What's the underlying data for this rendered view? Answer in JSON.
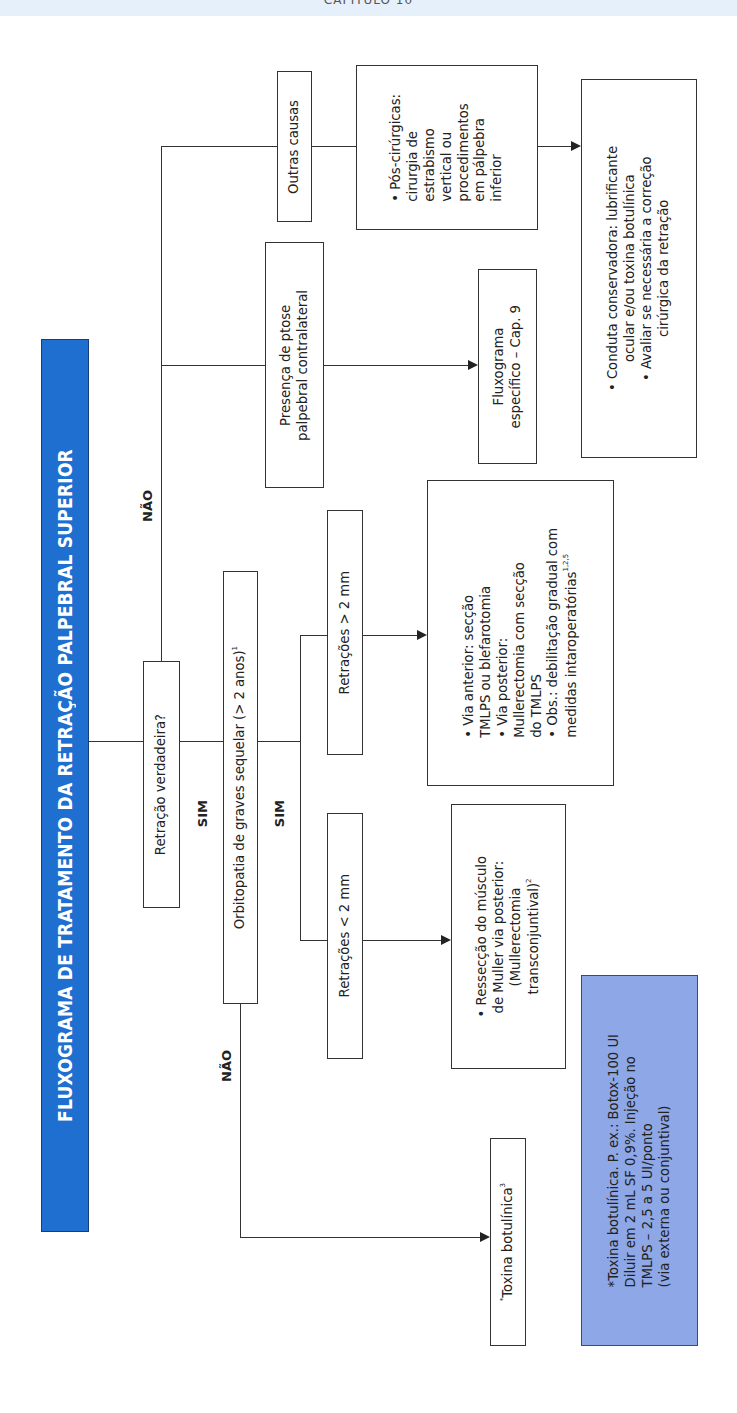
{
  "header": {
    "chapter": "CAPÍTULO 10"
  },
  "title": "FLUXOGRAMA DE TRATAMENTO DA RETRAÇÃO PALPEBRAL SUPERIOR",
  "colors": {
    "title_bg": "#1f6fd1",
    "note_bg": "#8ea7e6",
    "header_band": "#e6f0fb",
    "line": "#333333"
  },
  "nodes": {
    "retracao_verdadeira": {
      "label": "Retração verdadeira?"
    },
    "orbitopatia": {
      "label": "Orbitopatia de graves sequelar (> 2 anos)",
      "sup": "1"
    },
    "retracoes_menor": {
      "label": "Retrações < 2 mm"
    },
    "retracoes_maior": {
      "label": "Retrações > 2 mm"
    },
    "resseccao": {
      "lines": [
        "• Ressecção do músculo",
        "de Muller via posterior:",
        "(Mullerectomia",
        "transconjuntival)"
      ],
      "sup": "2"
    },
    "via_anterior": {
      "lines": [
        "• Via anterior:  secção",
        "TMLPS ou blefarotomia",
        "• Via posterior:",
        "Mullerectomia com secção",
        "do TMLPS",
        "• Obs.: debilitação gradual com",
        "medidas intaroperatórias"
      ],
      "sup": "1,2,5"
    },
    "toxina": {
      "prefix": "*",
      "label": "Toxina botulínica",
      "sup": "3"
    },
    "presenca_ptose": {
      "lines": [
        "Presença de ptose",
        "palpebral contralateral"
      ]
    },
    "fluxograma_especifico": {
      "lines": [
        "Fluxograma",
        "específico – Cap. 9"
      ]
    },
    "outras_causas": {
      "label": "Outras causas"
    },
    "pos_cirurgicas": {
      "lines": [
        "• Pós-cirúrgicas:",
        "cirurgia de",
        "estrabismo",
        "vertical ou",
        "procedimentos",
        "em pálpebra",
        "inferior"
      ]
    },
    "conduta": {
      "lines": [
        "• Conduta conservadora: lubrificante",
        "ocular e/ou toxina botulínica",
        "• Avaliar se necessária a correção",
        "cirúrgica da retração"
      ]
    }
  },
  "edge_labels": {
    "sim_1": "SIM",
    "sim_2": "SIM",
    "nao_top": "NÃO",
    "nao_bottom": "NÃO"
  },
  "note": {
    "lines": [
      "*Toxina botulínica. P. ex.: Botox-100 UI",
      "Diluir em 2 mL SF 0,9%. Injeção no",
      "TMLPS – 2,5 a 5 UI/ponto",
      "(via externa ou conjuntival)"
    ]
  }
}
